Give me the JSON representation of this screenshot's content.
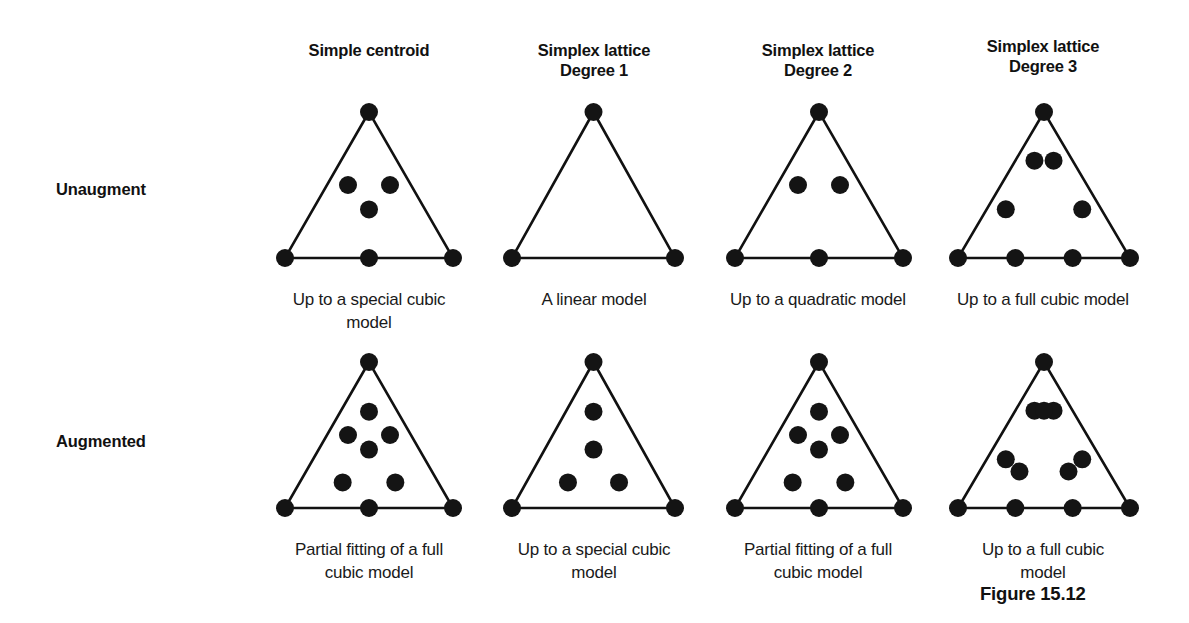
{
  "figure": {
    "number_label": "Figure 15.12",
    "background_color": "#ffffff",
    "ink_color": "#111111",
    "point_color": "#141414"
  },
  "row_labels": [
    {
      "id": "unaugmented",
      "label": "Unaugment"
    },
    {
      "id": "augmented",
      "label": "Augmented"
    }
  ],
  "columns": [
    {
      "id": "simple-centroid",
      "header": "Simple centroid"
    },
    {
      "id": "simplex-lattice-degree-1",
      "header": "Simplex lattice\nDegree 1"
    },
    {
      "id": "simplex-lattice-degree-2",
      "header": "Simplex lattice\nDegree 2"
    },
    {
      "id": "simplex-lattice-degree-3",
      "header": "Simplex lattice\nDegree 3"
    }
  ],
  "chart_data": {
    "type": "scatter",
    "xlabel": "",
    "ylabel": "",
    "grid": false,
    "legend": "none",
    "panels": [
      {
        "row": "Unaugment",
        "column": "Simple centroid",
        "caption": "Up to a special cubic\nmodel",
        "point_count": 7,
        "points": [
          {
            "u": 0.0,
            "v": 0.0,
            "kind": "vertex"
          },
          {
            "u": 1.0,
            "v": 0.0,
            "kind": "vertex"
          },
          {
            "u": 0.5,
            "v": 1.0,
            "kind": "vertex"
          },
          {
            "u": 0.5,
            "v": 0.0,
            "kind": "edge-midpoint"
          },
          {
            "u": 0.25,
            "v": 0.5,
            "kind": "edge-midpoint"
          },
          {
            "u": 0.75,
            "v": 0.5,
            "kind": "edge-midpoint"
          },
          {
            "u": 0.5,
            "v": 0.333,
            "kind": "centroid"
          }
        ]
      },
      {
        "row": "Unaugment",
        "column": "Simplex lattice Degree 1",
        "caption": "A linear model",
        "point_count": 3,
        "points": [
          {
            "u": 0.0,
            "v": 0.0,
            "kind": "vertex"
          },
          {
            "u": 1.0,
            "v": 0.0,
            "kind": "vertex"
          },
          {
            "u": 0.5,
            "v": 1.0,
            "kind": "vertex"
          }
        ]
      },
      {
        "row": "Unaugment",
        "column": "Simplex lattice Degree 2",
        "caption": "Up to a quadratic model",
        "point_count": 6,
        "points": [
          {
            "u": 0.0,
            "v": 0.0,
            "kind": "vertex"
          },
          {
            "u": 1.0,
            "v": 0.0,
            "kind": "vertex"
          },
          {
            "u": 0.5,
            "v": 1.0,
            "kind": "vertex"
          },
          {
            "u": 0.5,
            "v": 0.0,
            "kind": "edge-midpoint"
          },
          {
            "u": 0.25,
            "v": 0.5,
            "kind": "edge-midpoint"
          },
          {
            "u": 0.75,
            "v": 0.5,
            "kind": "edge-midpoint"
          }
        ]
      },
      {
        "row": "Unaugment",
        "column": "Simplex lattice Degree 3",
        "caption": "Up to a full cubic model",
        "point_count": 9,
        "points": [
          {
            "u": 0.0,
            "v": 0.0,
            "kind": "vertex"
          },
          {
            "u": 1.0,
            "v": 0.0,
            "kind": "vertex"
          },
          {
            "u": 0.5,
            "v": 1.0,
            "kind": "vertex"
          },
          {
            "u": 0.3333,
            "v": 0.0,
            "kind": "edge-third"
          },
          {
            "u": 0.6667,
            "v": 0.0,
            "kind": "edge-third"
          },
          {
            "u": 0.1667,
            "v": 0.3333,
            "kind": "edge-third"
          },
          {
            "u": 0.3333,
            "v": 0.6667,
            "kind": "edge-third"
          },
          {
            "u": 0.8333,
            "v": 0.3333,
            "kind": "edge-third"
          },
          {
            "u": 0.6667,
            "v": 0.6667,
            "kind": "edge-third"
          }
        ]
      },
      {
        "row": "Augmented",
        "column": "Simple centroid",
        "caption": "Partial fitting of a full\ncubic model",
        "point_count": 10,
        "points": [
          {
            "u": 0.0,
            "v": 0.0,
            "kind": "vertex"
          },
          {
            "u": 1.0,
            "v": 0.0,
            "kind": "vertex"
          },
          {
            "u": 0.5,
            "v": 1.0,
            "kind": "vertex"
          },
          {
            "u": 0.5,
            "v": 0.0,
            "kind": "edge-midpoint"
          },
          {
            "u": 0.25,
            "v": 0.5,
            "kind": "edge-midpoint"
          },
          {
            "u": 0.75,
            "v": 0.5,
            "kind": "edge-midpoint"
          },
          {
            "u": 0.5,
            "v": 0.66,
            "kind": "axial-interior"
          },
          {
            "u": 0.5,
            "v": 0.4,
            "kind": "centroid"
          },
          {
            "u": 0.31,
            "v": 0.175,
            "kind": "axial-interior"
          },
          {
            "u": 0.69,
            "v": 0.175,
            "kind": "axial-interior"
          }
        ]
      },
      {
        "row": "Augmented",
        "column": "Simplex lattice Degree 1",
        "caption": "Up to a special cubic\nmodel",
        "point_count": 7,
        "points": [
          {
            "u": 0.0,
            "v": 0.0,
            "kind": "vertex"
          },
          {
            "u": 1.0,
            "v": 0.0,
            "kind": "vertex"
          },
          {
            "u": 0.5,
            "v": 1.0,
            "kind": "vertex"
          },
          {
            "u": 0.5,
            "v": 0.66,
            "kind": "axial-interior"
          },
          {
            "u": 0.5,
            "v": 0.4,
            "kind": "centroid"
          },
          {
            "u": 0.31,
            "v": 0.175,
            "kind": "axial-interior"
          },
          {
            "u": 0.69,
            "v": 0.175,
            "kind": "axial-interior"
          }
        ]
      },
      {
        "row": "Augmented",
        "column": "Simplex lattice Degree 2",
        "caption": "Partial fitting of a full\ncubic model",
        "point_count": 10,
        "points": [
          {
            "u": 0.0,
            "v": 0.0,
            "kind": "vertex"
          },
          {
            "u": 1.0,
            "v": 0.0,
            "kind": "vertex"
          },
          {
            "u": 0.5,
            "v": 1.0,
            "kind": "vertex"
          },
          {
            "u": 0.5,
            "v": 0.0,
            "kind": "edge-midpoint"
          },
          {
            "u": 0.25,
            "v": 0.5,
            "kind": "edge-midpoint"
          },
          {
            "u": 0.75,
            "v": 0.5,
            "kind": "edge-midpoint"
          },
          {
            "u": 0.5,
            "v": 0.66,
            "kind": "axial-interior"
          },
          {
            "u": 0.5,
            "v": 0.4,
            "kind": "centroid"
          },
          {
            "u": 0.31,
            "v": 0.175,
            "kind": "axial-interior"
          },
          {
            "u": 0.69,
            "v": 0.175,
            "kind": "axial-interior"
          }
        ]
      },
      {
        "row": "Augmented",
        "column": "Simplex lattice Degree 3",
        "caption": "Up to a full cubic\nmodel",
        "point_count": 12,
        "points": [
          {
            "u": 0.0,
            "v": 0.0,
            "kind": "vertex"
          },
          {
            "u": 1.0,
            "v": 0.0,
            "kind": "vertex"
          },
          {
            "u": 0.5,
            "v": 1.0,
            "kind": "vertex"
          },
          {
            "u": 0.3333,
            "v": 0.0,
            "kind": "edge-third"
          },
          {
            "u": 0.6667,
            "v": 0.0,
            "kind": "edge-third"
          },
          {
            "u": 0.1667,
            "v": 0.3333,
            "kind": "edge-third"
          },
          {
            "u": 0.3333,
            "v": 0.6667,
            "kind": "edge-third"
          },
          {
            "u": 0.8333,
            "v": 0.3333,
            "kind": "edge-third"
          },
          {
            "u": 0.6667,
            "v": 0.6667,
            "kind": "edge-third"
          },
          {
            "u": 0.5,
            "v": 0.6667,
            "kind": "axial-interior"
          },
          {
            "u": 0.31,
            "v": 0.25,
            "kind": "axial-interior"
          },
          {
            "u": 0.69,
            "v": 0.25,
            "kind": "axial-interior"
          }
        ]
      }
    ]
  }
}
